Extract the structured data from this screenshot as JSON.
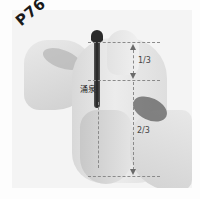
{
  "figure": {
    "page_label": "P76",
    "point_label": "涌泉",
    "measure_top": "1/3",
    "measure_bottom": "2/3"
  },
  "colors": {
    "skin_light": "#e6e6e6",
    "skin_mid": "#cfcfcf",
    "skin_dark": "#9a9a9a",
    "tool": "#3a3a3a",
    "guide": "#8a8a8a"
  }
}
